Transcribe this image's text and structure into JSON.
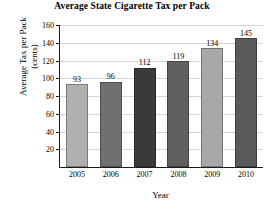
{
  "chart_data": {
    "type": "bar",
    "title": "Average State Cigarette Tax per Pack",
    "xlabel": "Year",
    "ylabel": "Average Tax per Pack (cents)",
    "ylabel_lines": [
      "Average Tax per Pack",
      "(cents)"
    ],
    "categories": [
      "2005",
      "2006",
      "2007",
      "2008",
      "2009",
      "2010"
    ],
    "values": [
      93,
      96,
      112,
      119,
      134,
      145
    ],
    "bar_colors": [
      "#b0b0b0",
      "#707070",
      "#3a3a3a",
      "#606060",
      "#a8a8a8",
      "#5a5a5a"
    ],
    "ylim": [
      0,
      160
    ],
    "yticks": [
      20,
      40,
      60,
      80,
      100,
      120,
      140,
      160
    ],
    "ytick_labels": [
      "20",
      "40",
      "60",
      "80",
      "100",
      "120",
      "140",
      "160"
    ],
    "grid": true,
    "legend": "none",
    "data_labels": [
      "93",
      "96",
      "112",
      "119",
      "134",
      "145"
    ]
  }
}
